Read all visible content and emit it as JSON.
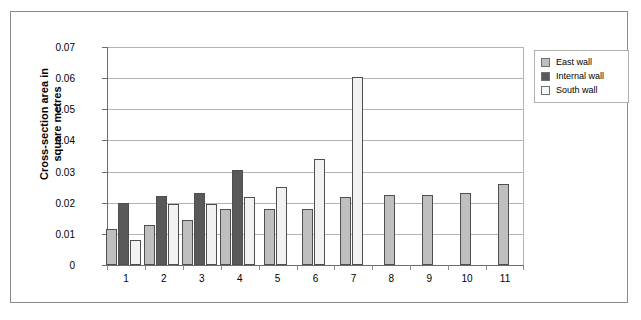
{
  "chart_data": {
    "type": "bar",
    "title": "",
    "xlabel": "",
    "ylabel": "Cross-section area in square metres",
    "ylabel_lines": [
      "Cross-section area in",
      "square metres"
    ],
    "categories": [
      "1",
      "2",
      "3",
      "4",
      "5",
      "6",
      "7",
      "8",
      "9",
      "10",
      "11"
    ],
    "series": [
      {
        "name": "East wall",
        "color": "#bfbfbf",
        "values": [
          0.0115,
          0.0127,
          0.0145,
          0.018,
          0.018,
          0.018,
          0.022,
          0.0225,
          0.0225,
          0.023,
          0.026
        ]
      },
      {
        "name": "Internal wall",
        "color": "#595959",
        "values": [
          0.02,
          0.0222,
          0.023,
          0.0305,
          null,
          null,
          null,
          null,
          null,
          null,
          null
        ]
      },
      {
        "name": "South wall",
        "color": "#f2f2f2",
        "values": [
          0.008,
          0.0195,
          0.0195,
          0.022,
          0.025,
          0.034,
          0.0605,
          null,
          null,
          null,
          null
        ]
      }
    ],
    "ylim": [
      0,
      0.07
    ],
    "ytick_values": [
      0,
      0.01,
      0.02,
      0.03,
      0.04,
      0.05,
      0.06,
      0.07
    ],
    "ytick_labels": [
      "0",
      "0.01",
      "0.02",
      "0.03",
      "0.04",
      "0.05",
      "0.06",
      "0.07"
    ],
    "grid": true,
    "legend_position": "right"
  },
  "legend": {
    "items": [
      {
        "label": "East wall",
        "key": "east"
      },
      {
        "label": "Internal wall",
        "key": "internal"
      },
      {
        "label": "South wall",
        "key": "south"
      }
    ]
  },
  "colors": {
    "east_wall": "#bfbfbf",
    "internal_wall": "#595959",
    "south_wall": "#f2f2f2",
    "gridline": "#b4b4b4",
    "axis": "#6b6b6b",
    "frame": "#8a8a8a"
  }
}
